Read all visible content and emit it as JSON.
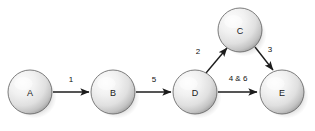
{
  "diagram": {
    "background_color": "#ffffff",
    "node_fill_light": "#fbfbfb",
    "node_fill_mid": "#e6e6e6",
    "node_fill_dark": "#9a9a9a",
    "node_stroke_color": "#5d5d5d",
    "edge_color": "#1c1c1c",
    "label_color": "#111111",
    "shadow_color": "#9b9b9b",
    "nodes": [
      {
        "id": "A",
        "label": "A",
        "cx": 30,
        "cy": 92,
        "r": 22
      },
      {
        "id": "B",
        "label": "B",
        "cx": 113,
        "cy": 92,
        "r": 22
      },
      {
        "id": "C",
        "label": "C",
        "cx": 240,
        "cy": 30,
        "r": 22
      },
      {
        "id": "D",
        "label": "D",
        "cx": 195,
        "cy": 92,
        "r": 22
      },
      {
        "id": "E",
        "label": "E",
        "cx": 282,
        "cy": 92,
        "r": 22
      }
    ],
    "edges": [
      {
        "id": "a-to-b",
        "from": "A",
        "to": "B",
        "label": "1",
        "label_x": 71,
        "label_y": 79,
        "x1": 53,
        "y1": 92,
        "x2": 89,
        "y2": 92
      },
      {
        "id": "b-to-d",
        "from": "B",
        "to": "D",
        "label": "5",
        "label_x": 154,
        "label_y": 79,
        "x1": 136,
        "y1": 92,
        "x2": 171,
        "y2": 92
      },
      {
        "id": "d-to-c",
        "from": "D",
        "to": "C",
        "label": "2",
        "label_x": 198,
        "label_y": 51,
        "x1": 206,
        "y1": 73,
        "x2": 227,
        "y2": 48
      },
      {
        "id": "c-to-e",
        "from": "C",
        "to": "E",
        "label": "3",
        "label_x": 270,
        "label_y": 49,
        "x1": 255,
        "y1": 47,
        "x2": 273,
        "y2": 70
      },
      {
        "id": "d-to-e",
        "from": "D",
        "to": "E",
        "label": "4 & 6",
        "label_x": 238,
        "label_y": 78,
        "x1": 218,
        "y1": 92,
        "x2": 257,
        "y2": 92
      }
    ]
  }
}
